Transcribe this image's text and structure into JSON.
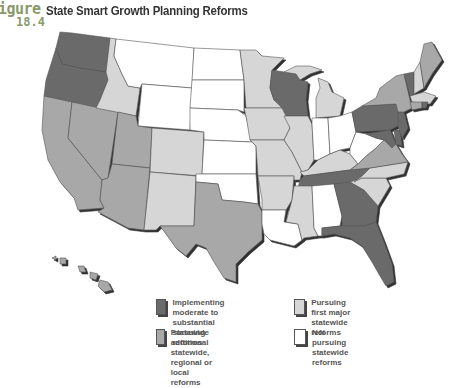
{
  "figure": {
    "label_word": "igure",
    "label_number": "18.4",
    "title": "State Smart Growth Planning Reforms"
  },
  "colors": {
    "implementing": "#6b6b6b",
    "additional": "#a8a8a8",
    "first_major": "#d6d6d6",
    "not_pursuing": "#ffffff",
    "border": "#555555",
    "label_accent": "#8a9a6a"
  },
  "legend": {
    "items": [
      {
        "key": "implementing",
        "label_line1": "Implementing moderate to",
        "label_line2": "substantial statewide reforms"
      },
      {
        "key": "first_major",
        "label_line1": "Pursuing first major",
        "label_line2": "statewide reforms"
      },
      {
        "key": "additional",
        "label_line1": "Pursuing additional statewide,",
        "label_line2": "regional or local reforms"
      },
      {
        "key": "not_pursuing",
        "label_line1": "Not pursuing",
        "label_line2": "statewide reforms"
      }
    ]
  },
  "states": {
    "implementing": [
      "Washington",
      "Oregon",
      "Wisconsin",
      "Tennessee",
      "Georgia",
      "Florida",
      "Pennsylvania",
      "Maryland",
      "New Jersey",
      "Vermont",
      "Rhode Island",
      "Delaware"
    ],
    "additional": [
      "California",
      "Nevada",
      "Utah",
      "Arizona",
      "Texas",
      "Hawaii",
      "New York",
      "Maine",
      "Virginia",
      "Connecticut"
    ],
    "first_major": [
      "Idaho",
      "Colorado",
      "New Mexico",
      "Minnesota",
      "Iowa",
      "Missouri",
      "Arkansas",
      "Illinois",
      "Michigan",
      "Kentucky",
      "Mississippi",
      "North Carolina",
      "South Carolina",
      "New Hampshire",
      "Massachusetts"
    ],
    "not_pursuing": [
      "Montana",
      "Wyoming",
      "North Dakota",
      "South Dakota",
      "Nebraska",
      "Kansas",
      "Oklahoma",
      "Louisiana",
      "Alabama",
      "Indiana",
      "Ohio",
      "West Virginia"
    ]
  }
}
